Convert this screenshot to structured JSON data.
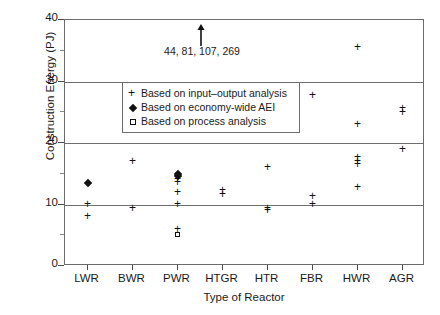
{
  "chart_data": {
    "type": "scatter",
    "title": "",
    "xlabel": "Type of Reactor",
    "ylabel": "Construction Energy (PJ)",
    "ylim": [
      0,
      40
    ],
    "yticks": [
      0,
      10,
      20,
      30,
      40
    ],
    "ytick_labels": [
      "0",
      "10",
      "20",
      "30",
      "40"
    ],
    "yminor_ticks": [
      5,
      15,
      25,
      35
    ],
    "grid": "horizontal gridlines at 10, 20, 30",
    "legend_position": "upper-left inside plot",
    "categories": [
      "LWR",
      "BWR",
      "PWR",
      "HTGR",
      "HTR",
      "FBR",
      "HWR",
      "AGR"
    ],
    "annotation": {
      "text": "44, 81, 107, 269",
      "arrow": "up-arrow",
      "points_to": "PWR off-scale values"
    },
    "series": [
      {
        "name": "Based on input-output analysis",
        "marker": "plus",
        "points": [
          {
            "category": "LWR",
            "value": 10.0
          },
          {
            "category": "LWR",
            "value": 8.0
          },
          {
            "category": "BWR",
            "value": 17.0
          },
          {
            "category": "BWR",
            "value": 9.3
          },
          {
            "category": "PWR",
            "value": 14.6
          },
          {
            "category": "PWR",
            "value": 14.0
          },
          {
            "category": "PWR",
            "value": 13.5
          },
          {
            "category": "PWR",
            "value": 12.0
          },
          {
            "category": "PWR",
            "value": 10.0
          },
          {
            "category": "PWR",
            "value": 6.0
          },
          {
            "category": "HTGR",
            "value": 12.2
          },
          {
            "category": "HTGR",
            "value": 11.7
          },
          {
            "category": "HTR",
            "value": 16.0
          },
          {
            "category": "HTR",
            "value": 9.3
          },
          {
            "category": "HTR",
            "value": 9.0
          },
          {
            "category": "FBR",
            "value": 27.8
          },
          {
            "category": "FBR",
            "value": 11.3
          },
          {
            "category": "FBR",
            "value": 10.0
          },
          {
            "category": "HWR",
            "value": 35.5
          },
          {
            "category": "HWR",
            "value": 23.0
          },
          {
            "category": "HWR",
            "value": 17.6
          },
          {
            "category": "HWR",
            "value": 17.0
          },
          {
            "category": "HWR",
            "value": 16.5
          },
          {
            "category": "HWR",
            "value": 12.7
          },
          {
            "category": "AGR",
            "value": 25.6
          },
          {
            "category": "AGR",
            "value": 25.0
          },
          {
            "category": "AGR",
            "value": 19.0
          }
        ]
      },
      {
        "name": "Based on economy-wide AEI",
        "marker": "diamond",
        "points": [
          {
            "category": "LWR",
            "value": 13.5
          },
          {
            "category": "PWR",
            "value": 15.0
          },
          {
            "category": "PWR",
            "value": 14.6
          }
        ]
      },
      {
        "name": "Based on process analysis",
        "marker": "square",
        "points": [
          {
            "category": "PWR",
            "value": 5.0
          }
        ]
      }
    ]
  },
  "axes": {
    "ylabel": "Construction Energy (PJ)",
    "xlabel": "Type of Reactor",
    "ytick_labels": [
      "0",
      "10",
      "20",
      "30",
      "40"
    ],
    "xtick_labels": [
      "LWR",
      "BWR",
      "PWR",
      "HTGR",
      "HTR",
      "FBR",
      "HWR",
      "AGR"
    ]
  },
  "legend": {
    "items": [
      {
        "marker": "plus",
        "label": "Based on input–output analysis"
      },
      {
        "marker": "diamond",
        "label": "Based on economy-wide AEI"
      },
      {
        "marker": "square",
        "label": "Based on process analysis"
      }
    ]
  },
  "annotation": {
    "text": "44, 81, 107, 269"
  }
}
